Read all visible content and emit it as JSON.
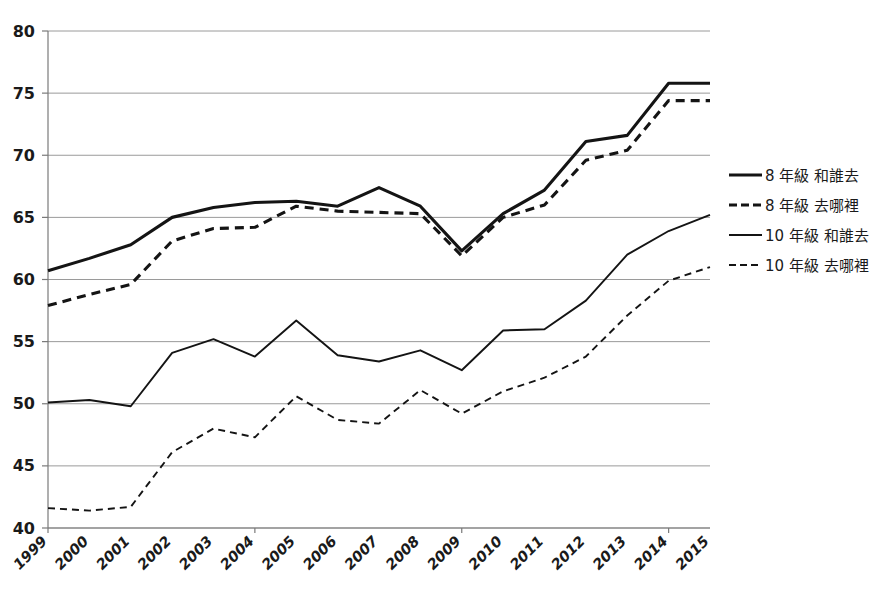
{
  "chart_data": {
    "type": "line",
    "title": "",
    "xlabel": "",
    "ylabel": "",
    "ylim": [
      40,
      80
    ],
    "ytick_step": 5,
    "yticks": [
      40,
      45,
      50,
      55,
      60,
      65,
      70,
      75,
      80
    ],
    "grid": true,
    "legend_position": "right",
    "categories": [
      "1999",
      "2000",
      "2001",
      "2002",
      "2003",
      "2004",
      "2005",
      "2006",
      "2007",
      "2008",
      "2009",
      "2010",
      "2011",
      "2012",
      "2013",
      "2014",
      "2015"
    ],
    "series": [
      {
        "name": "8 年級 和誰去",
        "style": "solid",
        "weight": "thick",
        "color": "#141414",
        "values": [
          60.7,
          61.7,
          62.8,
          65.0,
          65.8,
          66.2,
          66.3,
          65.9,
          67.4,
          65.9,
          62.3,
          65.3,
          67.2,
          71.1,
          71.6,
          75.8,
          75.8
        ]
      },
      {
        "name": "8 年級 去哪裡",
        "style": "dashed",
        "weight": "thick",
        "color": "#141414",
        "values": [
          57.9,
          58.8,
          59.6,
          63.1,
          64.1,
          64.2,
          65.9,
          65.5,
          65.4,
          65.3,
          61.9,
          65.0,
          66.0,
          69.6,
          70.4,
          74.4,
          74.4
        ]
      },
      {
        "name": "10 年級 和誰去",
        "style": "solid",
        "weight": "thin",
        "color": "#141414",
        "values": [
          50.1,
          50.3,
          49.8,
          54.1,
          55.2,
          53.8,
          56.7,
          53.9,
          53.4,
          54.3,
          52.7,
          55.9,
          56.0,
          58.3,
          62.0,
          63.9,
          65.2
        ]
      },
      {
        "name": "10 年級 去哪裡",
        "style": "dashed",
        "weight": "thin",
        "color": "#141414",
        "values": [
          41.6,
          41.4,
          41.7,
          46.1,
          48.0,
          47.3,
          50.6,
          48.7,
          48.4,
          51.1,
          49.2,
          51.0,
          52.1,
          53.8,
          57.1,
          59.9,
          61.0
        ]
      }
    ]
  },
  "legend": {
    "items": [
      {
        "label": "8 年級 和誰去",
        "style": "solid",
        "weight": "thick"
      },
      {
        "label": "8 年級 去哪裡",
        "style": "dashed",
        "weight": "thick"
      },
      {
        "label": "10 年級 和誰去",
        "style": "solid",
        "weight": "thin"
      },
      {
        "label": "10 年級 去哪裡",
        "style": "dashed",
        "weight": "thin"
      }
    ]
  }
}
